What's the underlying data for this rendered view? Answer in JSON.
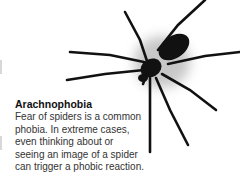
{
  "caption": {
    "title": "Arachnophobia",
    "body": "Fear of spiders is a common phobia. In extreme cases, even thinking about or seeing an image of a spider can trigger a phobic reaction."
  },
  "illustration": {
    "subject": "spider-silhouette",
    "color": "#111111",
    "shadow_color": "#999999"
  }
}
